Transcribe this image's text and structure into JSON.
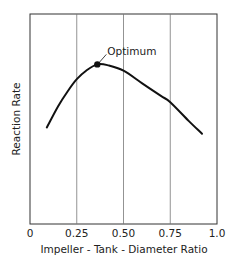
{
  "chart_data": {
    "type": "line",
    "title": "",
    "xlabel": "Impeller - Tank - Diameter Ratio",
    "ylabel": "Reaction Rate",
    "xlim": [
      0,
      1.0
    ],
    "ylim": [
      0,
      100
    ],
    "x_ticks": [
      0,
      0.25,
      0.5,
      0.75,
      1.0
    ],
    "x_tick_labels": [
      "0",
      "0.25",
      "0.50",
      "0.75",
      "1.0"
    ],
    "y_ticks": [],
    "y_tick_labels": [],
    "grid": {
      "vertical": true,
      "horizontal": false
    },
    "legend": null,
    "series": [
      {
        "name": "Reaction Rate",
        "x": [
          0.09,
          0.15,
          0.2,
          0.25,
          0.3,
          0.36,
          0.42,
          0.5,
          0.6,
          0.7,
          0.75,
          0.85,
          0.92
        ],
        "y": [
          46,
          56,
          63,
          69,
          73,
          76,
          75.5,
          73,
          67,
          61,
          58,
          49,
          43
        ]
      }
    ],
    "annotations": [
      {
        "text": "Optimum",
        "x": 0.36,
        "y": 76,
        "marker": "filled-circle"
      }
    ]
  },
  "labels": {
    "xlabel": "Impeller - Tank - Diameter Ratio",
    "ylabel": "Reaction Rate",
    "annotation": "Optimum",
    "ticks": [
      "0",
      "0.25",
      "0.50",
      "0.75",
      "1.0"
    ]
  },
  "colors": {
    "line": "#111111",
    "frame": "#333333",
    "grid": "#777777",
    "background": "#ffffff"
  }
}
